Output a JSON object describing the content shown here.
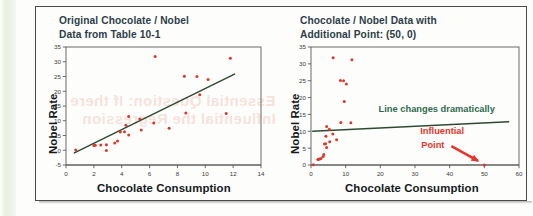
{
  "figure": {
    "panels": [
      {
        "id": "original",
        "title_line1": "Original Chocolate / Nobel",
        "title_line2": "Data from Table 10-1",
        "xlabel": "Chocolate Consumption",
        "ylabel": "Nobel Rate",
        "annotations": []
      },
      {
        "id": "with-influential-point",
        "title_line1": "Chocolate / Nobel Data with",
        "title_line2": "Additional Point: (50, 0)",
        "xlabel": "Chocolate Consumption",
        "ylabel": "Nobel Rate",
        "annotations": [
          {
            "id": "line-note",
            "text": "Line changes dramatically",
            "color": "#2f6b4f"
          },
          {
            "id": "influential-point-note-line1",
            "text": "Influential",
            "color": "#e8342a"
          },
          {
            "id": "influential-point-note-line2",
            "text": "Point",
            "color": "#e8342a"
          }
        ]
      }
    ],
    "ghost_text": {
      "line1": "Essential Question: If there",
      "line2": "Influential the Regression"
    },
    "colors": {
      "point": "#d8392b",
      "regression_line": "#2e4a33",
      "title": "#2c3d48",
      "axis": "#5b5b5b",
      "annotation_green": "#2f6b4f",
      "annotation_red": "#e8342a",
      "frame": "#4a4a4a",
      "page_edge": "#e9f0e0"
    }
  },
  "chart_data": [
    {
      "type": "scatter",
      "id": "original",
      "title": "Original Chocolate / Nobel Data from Table 10-1",
      "xlabel": "Chocolate Consumption",
      "ylabel": "Nobel Rate",
      "xlim": [
        0,
        14
      ],
      "ylim": [
        -5,
        35
      ],
      "xticks": [
        0,
        2,
        4,
        6,
        8,
        10,
        12,
        14
      ],
      "yticks": [
        -5,
        0,
        5,
        10,
        15,
        20,
        25,
        30,
        35
      ],
      "grid": false,
      "legend": "none",
      "points": [
        [
          0.7,
          0.1
        ],
        [
          2.0,
          1.6
        ],
        [
          2.1,
          1.7
        ],
        [
          2.5,
          1.8
        ],
        [
          2.9,
          1.9
        ],
        [
          2.9,
          -0.1
        ],
        [
          3.5,
          2.5
        ],
        [
          3.7,
          3.1
        ],
        [
          3.9,
          6.2
        ],
        [
          4.2,
          6.3
        ],
        [
          4.3,
          8.5
        ],
        [
          4.5,
          11.4
        ],
        [
          4.5,
          5.2
        ],
        [
          5.3,
          10.6
        ],
        [
          5.4,
          6.9
        ],
        [
          6.3,
          9.2
        ],
        [
          6.4,
          31.8
        ],
        [
          7.4,
          7.5
        ],
        [
          8.5,
          25.1
        ],
        [
          8.6,
          12.6
        ],
        [
          9.4,
          25.0
        ],
        [
          9.6,
          18.8
        ],
        [
          10.2,
          24.0
        ],
        [
          11.5,
          12.5
        ],
        [
          11.8,
          31.2
        ]
      ],
      "regression_line": {
        "x": [
          0.6,
          12.1
        ],
        "y": [
          -0.9,
          25.8
        ]
      },
      "series": [
        {
          "name": "Countries",
          "marker": "dot",
          "color": "#d8392b"
        },
        {
          "name": "Regression line",
          "marker": "line",
          "color": "#2e4a33"
        }
      ]
    },
    {
      "type": "scatter",
      "id": "with-influential-point",
      "title": "Chocolate / Nobel Data with Additional Point: (50, 0)",
      "xlabel": "Chocolate Consumption",
      "ylabel": "Nobel Rate",
      "xlim": [
        0,
        60
      ],
      "ylim": [
        0,
        35
      ],
      "xticks": [
        0,
        10,
        20,
        30,
        40,
        50,
        60
      ],
      "yticks": [
        0,
        5,
        10,
        15,
        20,
        25,
        30,
        35
      ],
      "grid": false,
      "legend": "none",
      "points": [
        [
          0.7,
          0.1
        ],
        [
          2.0,
          1.6
        ],
        [
          2.1,
          1.7
        ],
        [
          2.5,
          1.8
        ],
        [
          2.9,
          1.9
        ],
        [
          2.9,
          -0.1
        ],
        [
          3.5,
          2.5
        ],
        [
          3.7,
          3.1
        ],
        [
          3.9,
          6.2
        ],
        [
          4.2,
          6.3
        ],
        [
          4.3,
          8.5
        ],
        [
          4.5,
          11.4
        ],
        [
          4.5,
          5.2
        ],
        [
          5.3,
          10.6
        ],
        [
          5.4,
          6.9
        ],
        [
          6.3,
          9.2
        ],
        [
          6.4,
          31.8
        ],
        [
          7.4,
          7.5
        ],
        [
          8.5,
          25.1
        ],
        [
          8.6,
          12.6
        ],
        [
          9.4,
          25.0
        ],
        [
          9.6,
          18.8
        ],
        [
          10.2,
          24.0
        ],
        [
          11.5,
          12.5
        ],
        [
          11.8,
          31.2
        ],
        [
          50.0,
          0.0
        ]
      ],
      "influential_point": [
        50,
        0
      ],
      "regression_line": {
        "x": [
          0.5,
          57.0
        ],
        "y": [
          10.0,
          12.8
        ]
      },
      "annotations": [
        {
          "text": "Line changes dramatically",
          "x": 22,
          "y": 15.5,
          "color": "#2f6b4f"
        },
        {
          "text": "Influential Point",
          "x": 33,
          "y": 7.5,
          "color": "#e8342a"
        }
      ],
      "series": [
        {
          "name": "Countries",
          "marker": "dot",
          "color": "#d8392b"
        },
        {
          "name": "Regression line",
          "marker": "line",
          "color": "#2e4a33"
        }
      ]
    }
  ]
}
